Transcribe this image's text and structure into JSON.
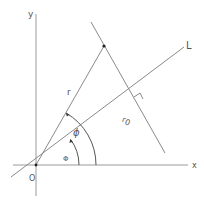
{
  "diagram": {
    "type": "geometry",
    "colors": {
      "line": "#8a8a8a",
      "text": "#555555",
      "point": "#222222"
    },
    "labels": {
      "y_axis": "y",
      "x_axis": "x",
      "origin": "O",
      "line": "L",
      "radius": "r",
      "perp_distance": "r0",
      "r0_base": "r",
      "r0_sub": "0",
      "big_angle": "ϕ",
      "small_angle": "Φ"
    }
  }
}
